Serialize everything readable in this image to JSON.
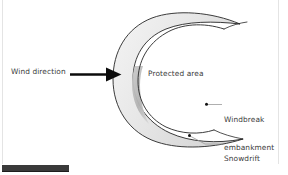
{
  "figure": {
    "background_color": "#ffffff",
    "labels": {
      "wind_direction": "Wind direction",
      "protected_area": "Protected area",
      "windbreak_line1": "Windbreak",
      "windbreak_line2": "embankment",
      "snowdrift_line1": "Snowdrift",
      "snowdrift_line2": "embankment"
    },
    "text_color": "#3b3b3b",
    "colors": {
      "outline": "#262626",
      "crescent_fill": "#ececec",
      "crescent_shadow": "#b5b5b5",
      "arrow": "#0b0b0b",
      "leader_line": "#9a9a9a",
      "frame": "#e4e4e4",
      "bottom_bar": "#3a3a3a"
    },
    "elements": {
      "wind_arrow": "arrow-right",
      "windbreak_marker": "dot-marker",
      "snowdrift_marker": "dot-marker",
      "crescent": "c-shaped-embankment"
    },
    "bottom_bar_label": ""
  }
}
